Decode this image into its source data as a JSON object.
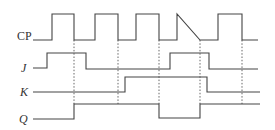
{
  "diagram": {
    "colors": {
      "line": "#444444",
      "guide": "#555555",
      "background": "#ffffff"
    },
    "signals": [
      {
        "id": "cp",
        "label": "CP",
        "italic": false,
        "label_pos": [
          17,
          36
        ],
        "points": "33,40 52,40 52,14 74,14 74,40 95,40 95,14 118,14 118,40 136,40 136,14 159,14 159,40 177,40 177,14 200,40 200,40 218,40 218,14 242,14 242,40 258,40"
      },
      {
        "id": "j",
        "label": "J",
        "italic": true,
        "label_pos": [
          20,
          64
        ],
        "points": "33,68 47,68 47,53 86,53 86,69 170,69 170,53 209,53 209,69 258,69"
      },
      {
        "id": "k",
        "label": "K",
        "italic": true,
        "label_pos": [
          20,
          87
        ],
        "points": "33,92 125,92 125,77 207,77 207,92 260,92"
      },
      {
        "id": "q",
        "label": "Q",
        "italic": true,
        "label_pos": [
          19,
          113
        ],
        "points": "33,119 74,119 74,104 159,104 159,118 200,118 200,104 260,104"
      }
    ],
    "guides": [
      {
        "x": 74,
        "y1": 40,
        "y2": 104
      },
      {
        "x": 118,
        "y1": 40,
        "y2": 104
      },
      {
        "x": 159,
        "y1": 40,
        "y2": 104
      },
      {
        "x": 200,
        "y1": 40,
        "y2": 104
      },
      {
        "x": 242,
        "y1": 40,
        "y2": 104
      }
    ]
  }
}
